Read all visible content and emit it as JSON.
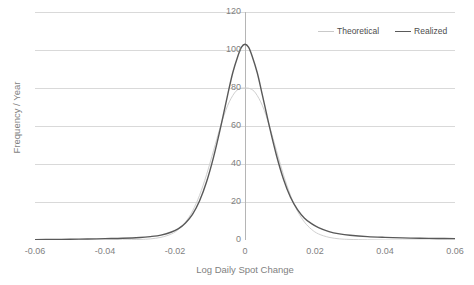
{
  "chart_data": {
    "type": "line",
    "title": "",
    "xlabel": "Log Daily Spot Change",
    "ylabel": "Frequency / Year",
    "xlim": [
      -0.06,
      0.06
    ],
    "ylim": [
      0,
      120
    ],
    "grid": true,
    "legend_position": "top-right",
    "x_ticks": [
      "-0.06",
      "-0.04",
      "-0.02",
      "0",
      "0.02",
      "0.04",
      "0.06"
    ],
    "x_tick_values": [
      -0.06,
      -0.04,
      -0.02,
      0,
      0.02,
      0.04,
      0.06
    ],
    "y_ticks": [
      "0",
      "20",
      "40",
      "60",
      "80",
      "100",
      "120"
    ],
    "y_tick_values": [
      0,
      20,
      40,
      60,
      80,
      100,
      120
    ],
    "series": [
      {
        "name": "Theoretical",
        "color": "#d0d0d0",
        "width": 1,
        "x": [
          -0.06,
          -0.055,
          -0.05,
          -0.045,
          -0.04,
          -0.035,
          -0.03,
          -0.027,
          -0.024,
          -0.021,
          -0.019,
          -0.017,
          -0.015,
          -0.013,
          -0.011,
          -0.009,
          -0.007,
          -0.005,
          -0.003,
          -0.0015,
          0.0,
          0.0015,
          0.003,
          0.005,
          0.007,
          0.009,
          0.011,
          0.013,
          0.015,
          0.017,
          0.019,
          0.021,
          0.024,
          0.027,
          0.03,
          0.035,
          0.04,
          0.045,
          0.05,
          0.055,
          0.06
        ],
        "y": [
          0.0,
          0.0,
          0.0,
          0.0,
          0.0,
          0.1,
          0.3,
          0.6,
          1.4,
          3.2,
          5.6,
          9.4,
          15.2,
          23.5,
          34.3,
          47.0,
          59.9,
          70.6,
          77.4,
          79.6,
          80.0,
          79.6,
          77.4,
          70.6,
          59.9,
          47.0,
          34.3,
          23.5,
          15.2,
          9.4,
          5.6,
          3.2,
          1.4,
          0.6,
          0.3,
          0.1,
          0.0,
          0.0,
          0.0,
          0.0,
          0.0
        ]
      },
      {
        "name": "Realized",
        "color": "#595959",
        "width": 1.4,
        "x": [
          -0.06,
          -0.055,
          -0.05,
          -0.045,
          -0.04,
          -0.035,
          -0.03,
          -0.027,
          -0.024,
          -0.021,
          -0.019,
          -0.017,
          -0.015,
          -0.013,
          -0.011,
          -0.009,
          -0.007,
          -0.005,
          -0.0035,
          -0.002,
          -0.001,
          0.0,
          0.001,
          0.002,
          0.0035,
          0.005,
          0.007,
          0.009,
          0.011,
          0.013,
          0.015,
          0.017,
          0.019,
          0.021,
          0.024,
          0.027,
          0.03,
          0.035,
          0.04,
          0.045,
          0.05,
          0.055,
          0.06
        ],
        "y": [
          0.2,
          0.3,
          0.4,
          0.5,
          0.7,
          0.9,
          1.3,
          1.8,
          2.6,
          4.2,
          6.0,
          9.0,
          13.5,
          20.5,
          30.5,
          43.5,
          59.0,
          76.0,
          88.0,
          97.0,
          101.5,
          103.0,
          101.5,
          97.0,
          88.0,
          76.0,
          59.5,
          44.5,
          32.0,
          22.5,
          16.0,
          11.5,
          8.6,
          6.5,
          4.4,
          3.2,
          2.5,
          1.8,
          1.4,
          1.1,
          0.9,
          0.8,
          0.7
        ]
      }
    ],
    "legend": [
      {
        "label": "Theoretical",
        "color": "#d0d0d0"
      },
      {
        "label": "Realized",
        "color": "#595959"
      }
    ]
  },
  "axes": {
    "x_title": "Log Daily Spot Change",
    "y_title": "Frequency / Year",
    "x_labels": [
      "-0.06",
      "-0.04",
      "-0.02",
      "0",
      "0.02",
      "0.04",
      "0.06"
    ],
    "y_labels": [
      "0",
      "20",
      "40",
      "60",
      "80",
      "100",
      "120"
    ]
  },
  "legend": {
    "items": [
      {
        "label": "Theoretical"
      },
      {
        "label": "Realized"
      }
    ]
  }
}
